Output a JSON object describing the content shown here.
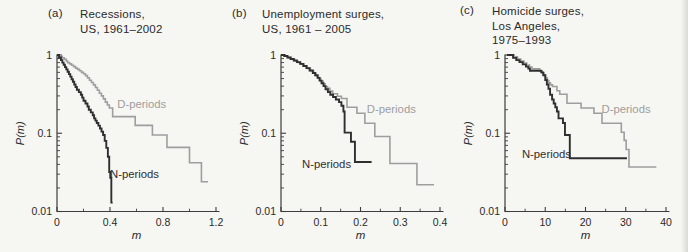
{
  "figure": {
    "background": "#f6f6f3"
  },
  "colors": {
    "background": "#f6f6f3",
    "axis": "#3d3d3d",
    "text": "#2a2a2a",
    "n_curve": "#2f2f2f",
    "d_curve": "#9e9e9e"
  },
  "chart_data": [
    {
      "type": "line",
      "letter": "(a)",
      "title_lines": [
        "Recessions,",
        "US, 1961–2002"
      ],
      "xlabel": "m",
      "ylabel": "P(m)",
      "xlim": [
        0,
        1.2
      ],
      "xticks": [
        0,
        0.4,
        0.8,
        1.2
      ],
      "xtick_labels": [
        "0",
        "0.4",
        "0.8",
        "1.2"
      ],
      "xminors": [
        0.2,
        0.6,
        1.0
      ],
      "yscale": "log",
      "ylim": [
        0.01,
        1
      ],
      "yticks": [
        1,
        0.1,
        0.01
      ],
      "ytick_labels": [
        "1",
        "0.1",
        "0.01"
      ],
      "grid": false,
      "legend": "inline-annotations",
      "series": [
        {
          "name": "D-periods",
          "color_key": "d_curve",
          "points": [
            [
              0,
              1
            ],
            [
              0.02,
              0.96
            ],
            [
              0.04,
              0.92
            ],
            [
              0.055,
              0.88
            ],
            [
              0.07,
              0.84
            ],
            [
              0.08,
              0.8
            ],
            [
              0.095,
              0.77
            ],
            [
              0.11,
              0.74
            ],
            [
              0.125,
              0.71
            ],
            [
              0.14,
              0.68
            ],
            [
              0.155,
              0.655
            ],
            [
              0.17,
              0.63
            ],
            [
              0.185,
              0.6
            ],
            [
              0.2,
              0.575
            ],
            [
              0.215,
              0.545
            ],
            [
              0.23,
              0.51
            ],
            [
              0.245,
              0.475
            ],
            [
              0.26,
              0.445
            ],
            [
              0.275,
              0.415
            ],
            [
              0.29,
              0.385
            ],
            [
              0.305,
              0.355
            ],
            [
              0.32,
              0.325
            ],
            [
              0.335,
              0.3
            ],
            [
              0.35,
              0.275
            ],
            [
              0.365,
              0.25
            ],
            [
              0.38,
              0.23
            ],
            [
              0.395,
              0.21
            ],
            [
              0.42,
              0.163
            ],
            [
              0.59,
              0.126
            ],
            [
              0.72,
              0.095
            ],
            [
              0.83,
              0.066
            ],
            [
              1.0,
              0.042
            ],
            [
              1.09,
              0.024
            ],
            [
              1.14,
              0.024
            ]
          ]
        },
        {
          "name": "N-periods",
          "color_key": "n_curve",
          "points": [
            [
              0,
              1
            ],
            [
              0.015,
              0.93
            ],
            [
              0.03,
              0.86
            ],
            [
              0.04,
              0.8
            ],
            [
              0.05,
              0.75
            ],
            [
              0.06,
              0.7
            ],
            [
              0.07,
              0.655
            ],
            [
              0.08,
              0.61
            ],
            [
              0.09,
              0.57
            ],
            [
              0.1,
              0.53
            ],
            [
              0.11,
              0.49
            ],
            [
              0.12,
              0.455
            ],
            [
              0.13,
              0.42
            ],
            [
              0.14,
              0.39
            ],
            [
              0.15,
              0.36
            ],
            [
              0.165,
              0.335
            ],
            [
              0.18,
              0.31
            ],
            [
              0.19,
              0.285
            ],
            [
              0.2,
              0.26
            ],
            [
              0.215,
              0.24
            ],
            [
              0.23,
              0.22
            ],
            [
              0.24,
              0.2
            ],
            [
              0.255,
              0.185
            ],
            [
              0.27,
              0.17
            ],
            [
              0.28,
              0.155
            ],
            [
              0.29,
              0.145
            ],
            [
              0.3,
              0.135
            ],
            [
              0.312,
              0.125
            ],
            [
              0.324,
              0.115
            ],
            [
              0.336,
              0.105
            ],
            [
              0.348,
              0.095
            ],
            [
              0.36,
              0.08
            ],
            [
              0.372,
              0.065
            ],
            [
              0.384,
              0.05
            ],
            [
              0.394,
              0.032
            ],
            [
              0.402,
              0.027
            ],
            [
              0.41,
              0.013
            ],
            [
              0.42,
              0.013
            ]
          ]
        }
      ],
      "annotations": [
        {
          "text": "D-periods",
          "x": 0.455,
          "y": 0.21,
          "color_key": "d_curve"
        },
        {
          "text": "N-periods",
          "x": 0.4,
          "y": 0.027,
          "color_key": "n_curve"
        }
      ]
    },
    {
      "type": "line",
      "letter": "(b)",
      "title_lines": [
        "Unemployment surges,",
        "US, 1961 – 2005"
      ],
      "xlabel": "m",
      "ylabel": "P(m)",
      "xlim": [
        0,
        0.4
      ],
      "xticks": [
        0,
        0.1,
        0.2,
        0.3,
        0.4
      ],
      "xtick_labels": [
        "0",
        "0.1",
        "0.2",
        "0.3",
        "0.4"
      ],
      "xminors": [
        0.05,
        0.15,
        0.25,
        0.35
      ],
      "yscale": "log",
      "ylim": [
        0.01,
        1
      ],
      "yticks": [
        1,
        0.1,
        0.01
      ],
      "ytick_labels": [
        "1",
        "0.1",
        "0.01"
      ],
      "grid": false,
      "legend": "inline-annotations",
      "series": [
        {
          "name": "D-periods",
          "color_key": "d_curve",
          "points": [
            [
              0,
              1
            ],
            [
              0.01,
              0.965
            ],
            [
              0.018,
              0.925
            ],
            [
              0.026,
              0.885
            ],
            [
              0.034,
              0.845
            ],
            [
              0.042,
              0.805
            ],
            [
              0.05,
              0.765
            ],
            [
              0.058,
              0.72
            ],
            [
              0.066,
              0.675
            ],
            [
              0.074,
              0.63
            ],
            [
              0.082,
              0.585
            ],
            [
              0.088,
              0.545
            ],
            [
              0.094,
              0.505
            ],
            [
              0.1,
              0.465
            ],
            [
              0.106,
              0.43
            ],
            [
              0.111,
              0.395
            ],
            [
              0.117,
              0.375
            ],
            [
              0.123,
              0.345
            ],
            [
              0.13,
              0.32
            ],
            [
              0.142,
              0.297
            ],
            [
              0.152,
              0.278
            ],
            [
              0.166,
              0.215
            ],
            [
              0.191,
              0.18
            ],
            [
              0.211,
              0.134
            ],
            [
              0.236,
              0.091
            ],
            [
              0.274,
              0.041
            ],
            [
              0.342,
              0.022
            ],
            [
              0.385,
              0.022
            ]
          ]
        },
        {
          "name": "N-periods",
          "color_key": "n_curve",
          "points": [
            [
              0,
              1
            ],
            [
              0.008,
              0.97
            ],
            [
              0.016,
              0.93
            ],
            [
              0.024,
              0.89
            ],
            [
              0.032,
              0.85
            ],
            [
              0.04,
              0.81
            ],
            [
              0.048,
              0.77
            ],
            [
              0.056,
              0.725
            ],
            [
              0.064,
              0.68
            ],
            [
              0.072,
              0.635
            ],
            [
              0.08,
              0.59
            ],
            [
              0.086,
              0.55
            ],
            [
              0.092,
              0.51
            ],
            [
              0.097,
              0.47
            ],
            [
              0.102,
              0.435
            ],
            [
              0.107,
              0.4
            ],
            [
              0.112,
              0.365
            ],
            [
              0.118,
              0.335
            ],
            [
              0.124,
              0.31
            ],
            [
              0.131,
              0.29
            ],
            [
              0.138,
              0.27
            ],
            [
              0.146,
              0.25
            ],
            [
              0.152,
              0.225
            ],
            [
              0.157,
              0.19
            ],
            [
              0.16,
              0.102
            ],
            [
              0.176,
              0.078
            ],
            [
              0.186,
              0.043
            ],
            [
              0.228,
              0.043
            ]
          ]
        }
      ],
      "annotations": [
        {
          "text": "D-periods",
          "x": 0.216,
          "y": 0.18,
          "color_key": "d_curve"
        },
        {
          "text": "N-periods",
          "x": 0.053,
          "y": 0.036,
          "color_key": "n_curve"
        }
      ]
    },
    {
      "type": "line",
      "letter": "(c)",
      "title_lines": [
        "Homicide surges,",
        "Los Angeles,",
        "1975–1993"
      ],
      "xlabel": "m",
      "ylabel": "P(m)",
      "xlim": [
        0,
        40
      ],
      "xticks": [
        0,
        10,
        20,
        30,
        40
      ],
      "xtick_labels": [
        "0",
        "10",
        "20",
        "30",
        "40"
      ],
      "xminors": [
        5,
        15,
        25,
        35
      ],
      "yscale": "log",
      "ylim": [
        0.01,
        1
      ],
      "yticks": [
        1,
        0.1,
        0.01
      ],
      "ytick_labels": [
        "1",
        "0.1",
        "0.01"
      ],
      "grid": false,
      "legend": "inline-annotations",
      "series": [
        {
          "name": "D-periods",
          "color_key": "d_curve",
          "points": [
            [
              0.8,
              1
            ],
            [
              2.3,
              0.95
            ],
            [
              3.1,
              0.89
            ],
            [
              3.9,
              0.84
            ],
            [
              4.7,
              0.79
            ],
            [
              5.4,
              0.745
            ],
            [
              6.1,
              0.7
            ],
            [
              6.7,
              0.665
            ],
            [
              8.6,
              0.63
            ],
            [
              9.2,
              0.59
            ],
            [
              9.7,
              0.55
            ],
            [
              10.1,
              0.51
            ],
            [
              10.5,
              0.47
            ],
            [
              10.9,
              0.44
            ],
            [
              11.3,
              0.415
            ],
            [
              11.8,
              0.395
            ],
            [
              12.9,
              0.35
            ],
            [
              13.6,
              0.315
            ],
            [
              15.4,
              0.242
            ],
            [
              18.9,
              0.21
            ],
            [
              22.1,
              0.18
            ],
            [
              24.1,
              0.134
            ],
            [
              28.9,
              0.103
            ],
            [
              29.6,
              0.081
            ],
            [
              30.1,
              0.062
            ],
            [
              30.8,
              0.037
            ],
            [
              37.6,
              0.037
            ]
          ]
        },
        {
          "name": "N-periods",
          "color_key": "n_curve",
          "points": [
            [
              0.5,
              1
            ],
            [
              2,
              0.92
            ],
            [
              2.8,
              0.86
            ],
            [
              3.6,
              0.81
            ],
            [
              4.4,
              0.76
            ],
            [
              5.2,
              0.71
            ],
            [
              5.8,
              0.67
            ],
            [
              6.2,
              0.63
            ],
            [
              9.0,
              0.6
            ],
            [
              9.5,
              0.55
            ],
            [
              10.0,
              0.48
            ],
            [
              10.4,
              0.42
            ],
            [
              10.8,
              0.37
            ],
            [
              11.2,
              0.31
            ],
            [
              11.7,
              0.27
            ],
            [
              12.1,
              0.24
            ],
            [
              12.5,
              0.215
            ],
            [
              12.9,
              0.19
            ],
            [
              13.3,
              0.155
            ],
            [
              14.4,
              0.135
            ],
            [
              14.9,
              0.095
            ],
            [
              16.1,
              0.048
            ],
            [
              30.3,
              0.048
            ]
          ]
        }
      ],
      "annotations": [
        {
          "text": "D-periods",
          "x": 24.0,
          "y": 0.183,
          "color_key": "d_curve"
        },
        {
          "text": "N-periods",
          "x": 4.2,
          "y": 0.048,
          "color_key": "n_curve"
        }
      ]
    }
  ]
}
